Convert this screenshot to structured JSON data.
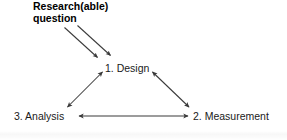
{
  "diagram": {
    "title_lines": [
      "Research(able)",
      "question"
    ],
    "stroke_color": "#3a3a3a",
    "text_color": "#1a1a1a",
    "background_color": "#ffffff",
    "nodes": [
      {
        "id": "design",
        "label": "1. Design"
      },
      {
        "id": "measurement",
        "label": "2. Measurement"
      },
      {
        "id": "analysis",
        "label": "3. Analysis"
      }
    ],
    "edges": [
      {
        "from": "question",
        "to": "design",
        "style": "single-arrow",
        "variant": "upper"
      },
      {
        "from": "question",
        "to": "design",
        "style": "single-arrow",
        "variant": "lower"
      },
      {
        "from": "design",
        "to": "analysis",
        "style": "double-arrow"
      },
      {
        "from": "design",
        "to": "measurement",
        "style": "double-arrow"
      },
      {
        "from": "analysis",
        "to": "measurement",
        "style": "double-arrow"
      }
    ]
  }
}
